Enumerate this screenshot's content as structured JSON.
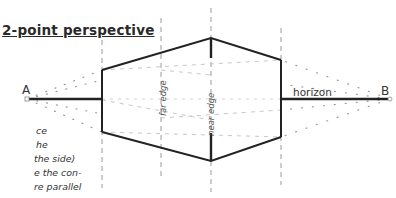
{
  "title": "2-point perspective",
  "side_text": {
    "lines": [
      "ce",
      "he",
      "the side)",
      "e the con-",
      "re parallel"
    ]
  },
  "labels": {
    "vanishing_point_left": "A",
    "vanishing_point_right": "B",
    "horizon": "horizon",
    "far_edge": "far edge",
    "near_edge": "near edge"
  },
  "diagram": {
    "horizon_y": 99,
    "vp_left": {
      "x": 27,
      "y": 99
    },
    "vp_right": {
      "x": 390,
      "y": 99
    },
    "box_vertices": {
      "left_top": {
        "x": 102,
        "y": 70
      },
      "left_bottom": {
        "x": 102,
        "y": 132
      },
      "near_top": {
        "x": 211,
        "y": 38
      },
      "near_bottom": {
        "x": 211,
        "y": 161
      },
      "right_top": {
        "x": 281,
        "y": 60
      },
      "right_bottom": {
        "x": 281,
        "y": 137
      }
    },
    "dashed_verticals_x": [
      102,
      161,
      211,
      281
    ],
    "colors": {
      "line": "#222222",
      "dashed": "#9a9a9a",
      "dotted": "#aaaaaa"
    }
  }
}
